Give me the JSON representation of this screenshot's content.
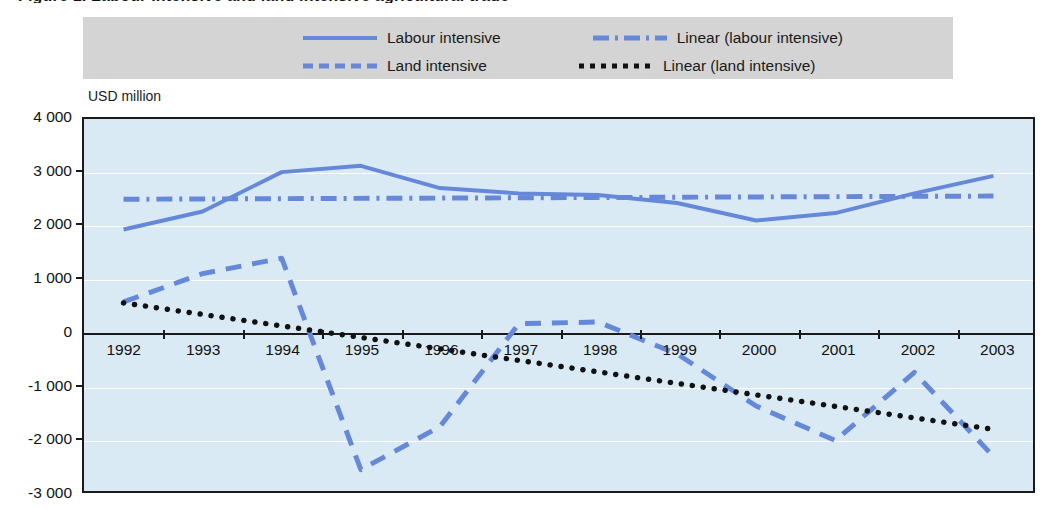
{
  "title_sliver": "Figure 1. Labour intensive and land intensive agricultural trade",
  "axis_unit_label": "USD million",
  "legend": {
    "items": [
      {
        "label": "Labour intensive",
        "style": "solid",
        "color": "#6688d8"
      },
      {
        "label": "Linear (labour intensive)",
        "style": "dashdot",
        "color": "#6688d8"
      },
      {
        "label": "Land intensive",
        "style": "dash",
        "color": "#6688d8"
      },
      {
        "label": "Linear (land intensive)",
        "style": "dotted",
        "color": "#111111"
      }
    ]
  },
  "chart_data": {
    "type": "line",
    "title": "",
    "xlabel": "",
    "ylabel": "USD million",
    "ylim": [
      -3000,
      4000
    ],
    "ytick_labels": [
      "4 000",
      "3 000",
      "2 000",
      "1 000",
      "0",
      "-1 000",
      "-2 000",
      "-3 000"
    ],
    "ytick_values": [
      4000,
      3000,
      2000,
      1000,
      0,
      -1000,
      -2000,
      -3000
    ],
    "grid": true,
    "legend_position": "top",
    "categories": [
      "1992",
      "1993",
      "1994",
      "1995",
      "1996",
      "1997",
      "1998",
      "1999",
      "2000",
      "2001",
      "2002",
      "2003"
    ],
    "series": [
      {
        "name": "Labour intensive",
        "style": "solid",
        "color": "#6688d8",
        "values": [
          1920,
          2260,
          3000,
          3120,
          2700,
          2600,
          2570,
          2420,
          2090,
          2230,
          2600,
          2930
        ]
      },
      {
        "name": "Land intensive",
        "style": "dash",
        "color": "#6688d8",
        "values": [
          560,
          1090,
          1380,
          -2600,
          -1790,
          150,
          180,
          -420,
          -1400,
          -2050,
          -770,
          -2350
        ]
      },
      {
        "name": "Linear (labour intensive)",
        "style": "dashdot",
        "color": "#6688d8",
        "trend": true,
        "endpoints": [
          2490,
          2550
        ]
      },
      {
        "name": "Linear (land intensive)",
        "style": "dotted",
        "color": "#111111",
        "trend": true,
        "endpoints": [
          540,
          -1840
        ]
      }
    ]
  }
}
